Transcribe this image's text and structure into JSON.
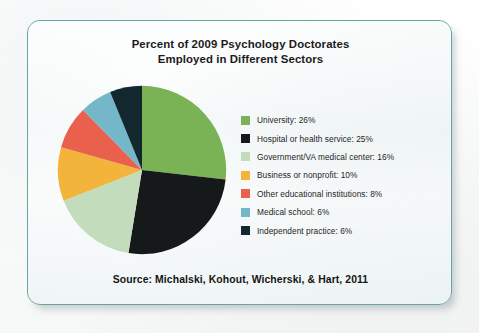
{
  "card": {
    "border_color": "#6aa3a3",
    "background_color": "#f2f7f7"
  },
  "title": {
    "line1": "Percent of 2009 Psychology Doctorates",
    "line2": "Employed in Different Sectors"
  },
  "source": {
    "text": "Source: Michalski, Kohout, Wicherski, & Hart, 2011"
  },
  "chart_data": {
    "type": "pie",
    "title": "Percent of 2009 Psychology Doctorates Employed in Different Sectors",
    "subtitle": "",
    "xlabel": "",
    "ylabel": "",
    "legend_position": "right",
    "start_angle_deg": 0,
    "direction": "clockwise",
    "categories": [
      "University",
      "Hospital or health service",
      "Government/VA medical center",
      "Business or nonprofit",
      "Other educational institutions",
      "Medical school",
      "Independent practice"
    ],
    "values": [
      26,
      25,
      16,
      10,
      8,
      6,
      6
    ],
    "unit": "%",
    "colors": [
      "#7ab356",
      "#16191a",
      "#c3dcbb",
      "#f2b43a",
      "#e9614c",
      "#73b7c9",
      "#12282e"
    ],
    "legend": [
      {
        "label": "University: 26%",
        "name": "University",
        "value": 26,
        "color": "#7ab356"
      },
      {
        "label": "Hospital or health service: 25%",
        "name": "Hospital or health service",
        "value": 25,
        "color": "#16191a"
      },
      {
        "label": "Government/VA medical center: 16%",
        "name": "Government/VA medical center",
        "value": 16,
        "color": "#c3dcbb"
      },
      {
        "label": "Business or nonprofit: 10%",
        "name": "Business or nonprofit",
        "value": 10,
        "color": "#f2b43a"
      },
      {
        "label": "Other educational institutions: 8%",
        "name": "Other educational institutions",
        "value": 8,
        "color": "#e9614c"
      },
      {
        "label": "Medical school: 6%",
        "name": "Medical school",
        "value": 6,
        "color": "#73b7c9"
      },
      {
        "label": "Independent practice: 6%",
        "name": "Independent practice",
        "value": 6,
        "color": "#12282e"
      }
    ]
  }
}
